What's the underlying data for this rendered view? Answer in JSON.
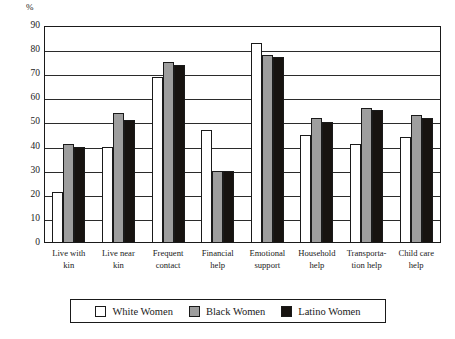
{
  "chart_data": {
    "type": "bar",
    "title": "",
    "subtitle": "",
    "xlabel": "",
    "ylabel": "%",
    "ylim": [
      0,
      90
    ],
    "ytick_step": 10,
    "yticks": [
      0,
      10,
      20,
      30,
      40,
      50,
      60,
      70,
      80,
      90
    ],
    "grid": true,
    "legend_position": "bottom",
    "categories": [
      "Live with kin",
      "Live near kin",
      "Frequent contact",
      "Financial help",
      "Emotional support",
      "Household help",
      "Transporta- tion help",
      "Child care help"
    ],
    "series": [
      {
        "name": "White Women",
        "color": "#ffffff",
        "values": [
          21,
          40,
          69,
          47,
          83,
          45,
          41,
          44
        ]
      },
      {
        "name": "Black Women",
        "color": "#9e9e9e",
        "values": [
          41,
          54,
          75,
          30,
          78,
          52,
          56,
          53
        ]
      },
      {
        "name": "Latino Women",
        "color": "#171310",
        "values": [
          40,
          51,
          74,
          30,
          77,
          50,
          55,
          52
        ]
      }
    ]
  },
  "axis": {
    "percent_symbol": "%",
    "tick_labels": [
      "90",
      "80",
      "70",
      "60",
      "50",
      "40",
      "30",
      "20",
      "10",
      "0"
    ]
  },
  "xlabels": [
    {
      "line1": "Live with",
      "line2": "kin"
    },
    {
      "line1": "Live near",
      "line2": "kin"
    },
    {
      "line1": "Frequent",
      "line2": "contact"
    },
    {
      "line1": "Financial",
      "line2": "help"
    },
    {
      "line1": "Emotional",
      "line2": "support"
    },
    {
      "line1": "Household",
      "line2": "help"
    },
    {
      "line1": "Transporta-",
      "line2": "tion help"
    },
    {
      "line1": "Child care",
      "line2": "help"
    }
  ],
  "legend": {
    "items": [
      {
        "label": "White Women",
        "swatch": "white"
      },
      {
        "label": "Black Women",
        "swatch": "gray"
      },
      {
        "label": "Latino Women",
        "swatch": "black"
      }
    ]
  }
}
